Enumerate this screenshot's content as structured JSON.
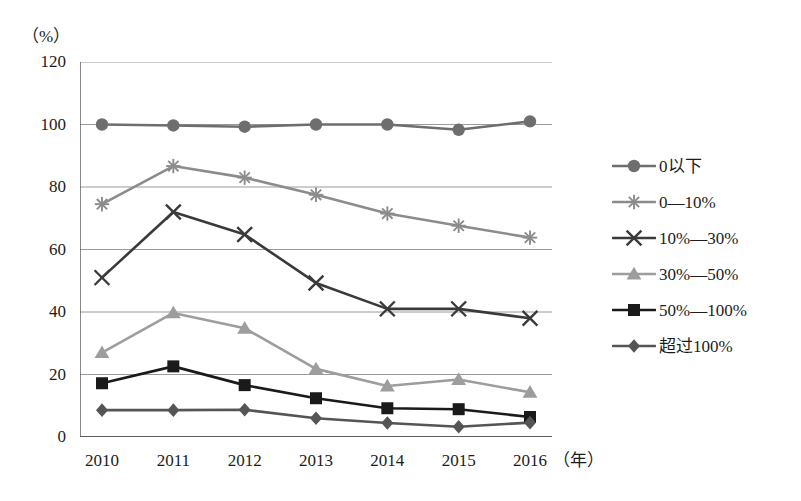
{
  "chart_data": {
    "type": "line",
    "title": "",
    "xlabel": "年",
    "ylabel": "%",
    "x": [
      "2010",
      "2011",
      "2012",
      "2013",
      "2014",
      "2015",
      "2016"
    ],
    "categories": [
      "2010",
      "2011",
      "2012",
      "2013",
      "2014",
      "2015",
      "2016"
    ],
    "ylim": [
      0,
      120
    ],
    "yticks": [
      0,
      20,
      40,
      60,
      80,
      100,
      120
    ],
    "grid": true,
    "legend_position": "right",
    "series": [
      {
        "name": "0以下",
        "marker": "circle",
        "color": "#6e6e6e",
        "values": [
          100,
          99.7,
          99.3,
          100,
          100,
          98.3,
          101
        ]
      },
      {
        "name": "0—10%",
        "marker": "asterisk",
        "color": "#8c8c8c",
        "values": [
          74.5,
          86.7,
          83,
          77.5,
          71.5,
          67.6,
          63.8
        ]
      },
      {
        "name": "10%—30%",
        "marker": "cross-x",
        "color": "#3a3a3a",
        "values": [
          51,
          72,
          64.8,
          49.3,
          41,
          41,
          38
        ]
      },
      {
        "name": "30%—50%",
        "marker": "triangle",
        "color": "#9d9d9d",
        "values": [
          27,
          39.7,
          34.8,
          21.8,
          16.3,
          18.4,
          14.3
        ]
      },
      {
        "name": "50%—100%",
        "marker": "square",
        "color": "#1a1a1a",
        "values": [
          17.2,
          22.6,
          16.6,
          12.4,
          9.2,
          8.9,
          6.4
        ]
      },
      {
        "name": "超过100%",
        "marker": "diamond",
        "color": "#555555",
        "values": [
          8.6,
          8.6,
          8.7,
          6,
          4.5,
          3.3,
          4.6
        ]
      }
    ]
  },
  "axis": {
    "unit_label": "（%）",
    "x_unit_label": "（年）"
  },
  "legend": {
    "items": [
      {
        "label": "0以下"
      },
      {
        "label": "0—10%"
      },
      {
        "label": "10%—30%"
      },
      {
        "label": "30%—50%"
      },
      {
        "label": "50%—100%"
      },
      {
        "label": "超过100%"
      }
    ]
  }
}
